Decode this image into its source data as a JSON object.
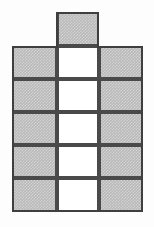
{
  "figure": {
    "name": "Cross-shaped polyomino net",
    "canvas": {
      "width": 154,
      "height": 227,
      "background": "#fdfdfd"
    },
    "style": {
      "border_color": "#4a4a4a",
      "border_width_px": 2,
      "gray_fill": "#b9b9b9",
      "white_fill": "#ffffff"
    },
    "grid": {
      "columns": 3,
      "rows": 5,
      "column_edges_px": [
        12,
        57,
        99,
        143
      ],
      "row_edges_px": [
        46,
        79,
        112,
        145,
        178,
        212
      ],
      "cell_width_px": 43,
      "cell_height_px": 33
    },
    "tab": {
      "present": true,
      "column_index": 1,
      "x_px": 57,
      "y_px": 12,
      "width_px": 42,
      "height_px": 34,
      "fill": "gray"
    },
    "counts": {
      "total_squares": 16,
      "gray_squares": 11,
      "white_squares": 5
    },
    "cells": [
      {
        "id": "tab",
        "col": 1,
        "row": -1,
        "x": 57,
        "y": 12,
        "w": 42,
        "h": 34,
        "fill": "gray"
      },
      {
        "id": "r0c0",
        "col": 0,
        "row": 0,
        "x": 12,
        "y": 46,
        "w": 45,
        "h": 33,
        "fill": "gray"
      },
      {
        "id": "r0c1",
        "col": 1,
        "row": 0,
        "x": 57,
        "y": 46,
        "w": 42,
        "h": 33,
        "fill": "white"
      },
      {
        "id": "r0c2",
        "col": 2,
        "row": 0,
        "x": 99,
        "y": 46,
        "w": 44,
        "h": 33,
        "fill": "gray"
      },
      {
        "id": "r1c0",
        "col": 0,
        "row": 1,
        "x": 12,
        "y": 79,
        "w": 45,
        "h": 33,
        "fill": "gray"
      },
      {
        "id": "r1c1",
        "col": 1,
        "row": 1,
        "x": 57,
        "y": 79,
        "w": 42,
        "h": 33,
        "fill": "white"
      },
      {
        "id": "r1c2",
        "col": 2,
        "row": 1,
        "x": 99,
        "y": 79,
        "w": 44,
        "h": 33,
        "fill": "gray"
      },
      {
        "id": "r2c0",
        "col": 0,
        "row": 2,
        "x": 12,
        "y": 112,
        "w": 45,
        "h": 33,
        "fill": "gray"
      },
      {
        "id": "r2c1",
        "col": 1,
        "row": 2,
        "x": 57,
        "y": 112,
        "w": 42,
        "h": 33,
        "fill": "white"
      },
      {
        "id": "r2c2",
        "col": 2,
        "row": 2,
        "x": 99,
        "y": 112,
        "w": 44,
        "h": 33,
        "fill": "gray"
      },
      {
        "id": "r3c0",
        "col": 0,
        "row": 3,
        "x": 12,
        "y": 145,
        "w": 45,
        "h": 33,
        "fill": "gray"
      },
      {
        "id": "r3c1",
        "col": 1,
        "row": 3,
        "x": 57,
        "y": 145,
        "w": 42,
        "h": 33,
        "fill": "white"
      },
      {
        "id": "r3c2",
        "col": 2,
        "row": 3,
        "x": 99,
        "y": 145,
        "w": 44,
        "h": 33,
        "fill": "gray"
      },
      {
        "id": "r4c0",
        "col": 0,
        "row": 4,
        "x": 12,
        "y": 178,
        "w": 45,
        "h": 34,
        "fill": "gray"
      },
      {
        "id": "r4c1",
        "col": 1,
        "row": 4,
        "x": 57,
        "y": 178,
        "w": 42,
        "h": 34,
        "fill": "white"
      },
      {
        "id": "r4c2",
        "col": 2,
        "row": 4,
        "x": 99,
        "y": 178,
        "w": 44,
        "h": 34,
        "fill": "gray"
      }
    ]
  }
}
